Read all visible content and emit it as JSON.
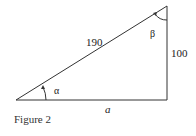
{
  "figure": {
    "caption": "Figure 2",
    "hypotenuse_label": "190",
    "opposite_label": "100",
    "adjacent_label": "a",
    "angle_alpha": "α",
    "angle_beta": "β",
    "stroke_color": "#333333"
  }
}
